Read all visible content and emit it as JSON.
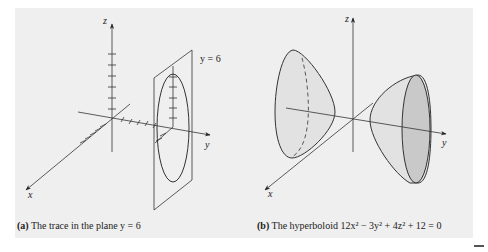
{
  "figure_a": {
    "caption_label": "(a)",
    "caption_text": " The trace in the plane y = 6",
    "plane_label": "y = 6",
    "axis_labels": {
      "x": "x",
      "y": "y",
      "z": "z"
    }
  },
  "figure_b": {
    "caption_label": "(b)",
    "caption_text": " The hyperboloid 12x² − 3y² + 4z² + 12 = 0",
    "axis_labels": {
      "x": "x",
      "y": "y",
      "z": "z"
    }
  },
  "colors": {
    "panel_bg": "#efefef",
    "line": "#333333",
    "surface_fill": "#e2e2e2",
    "surface_shadow": "#c9c9c9"
  }
}
